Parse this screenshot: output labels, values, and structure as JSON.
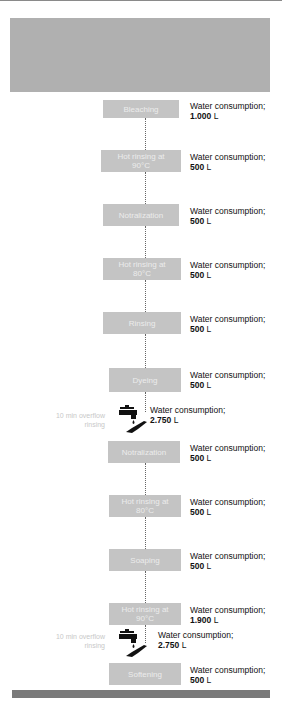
{
  "diagram": {
    "consumption_label": "Water consumption;",
    "steps": [
      {
        "label": "Bleaching",
        "value": "1.000",
        "unit": "L"
      },
      {
        "label": "Hot rinsing at\n90°C",
        "value": "500",
        "unit": "L"
      },
      {
        "label": "Notralization",
        "value": "500",
        "unit": "L"
      },
      {
        "label": "Hot rinsing at\n80°C",
        "value": "500",
        "unit": "L"
      },
      {
        "label": "Rinsing",
        "value": "500",
        "unit": "L"
      },
      {
        "label": "Dyeing",
        "value": "500",
        "unit": "L"
      },
      {
        "label": "Notralization",
        "value": "500",
        "unit": "L"
      },
      {
        "label": "Hot rinsing at\n80°C",
        "value": "500",
        "unit": "L"
      },
      {
        "label": "Soaping",
        "value": "500",
        "unit": "L"
      },
      {
        "label": "Hot rinsing at\n90°C",
        "value": "1.900",
        "unit": "L"
      },
      {
        "label": "Softening",
        "value": "500",
        "unit": "L"
      }
    ],
    "overflow": [
      {
        "label": "10 min\noverflow rinsing",
        "value": "2.750",
        "unit": "L",
        "icon": "faucet-hand-icon"
      },
      {
        "label": "10 min\noverflow rinsing",
        "value": "2.750",
        "unit": "L",
        "icon": "faucet-hand-icon"
      }
    ]
  },
  "colors": {
    "header_band": "#b0b0b0",
    "step_box": "#c4c4c4",
    "bottom_band": "#7a7a7a"
  }
}
